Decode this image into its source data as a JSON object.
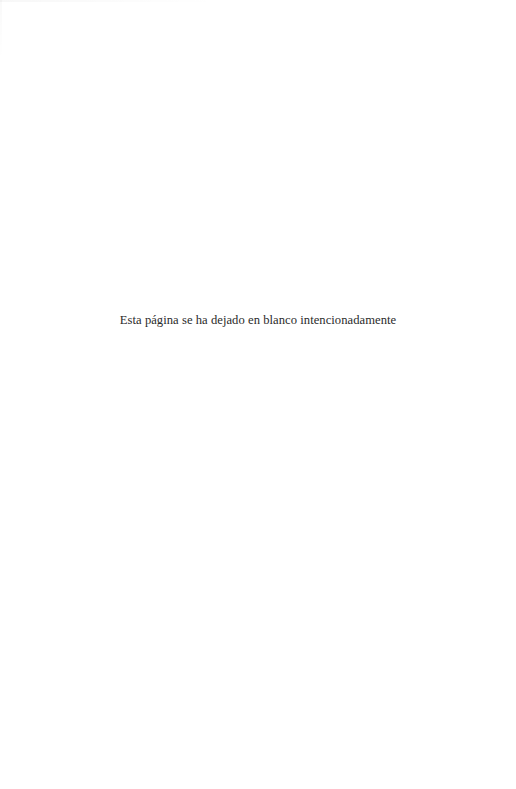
{
  "page": {
    "notice": "Esta página se ha dejado en blanco intencionadamente"
  },
  "colors": {
    "background": "#ffffff",
    "text": "#2b2b2b"
  }
}
